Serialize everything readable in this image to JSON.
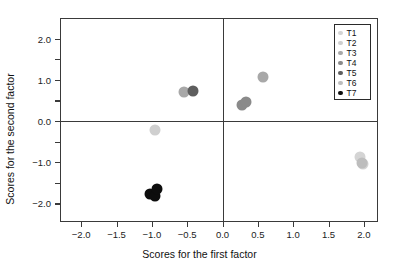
{
  "chart_data": {
    "type": "scatter",
    "title": "",
    "xlabel": "Scores for the first factor",
    "ylabel": "Scores for the second factor",
    "xlim": [
      -2.3,
      2.2
    ],
    "ylim": [
      -2.45,
      2.5
    ],
    "xticks": [
      "-2.0",
      "-1.5",
      "-1.0",
      "-0.5",
      "0.0",
      "0.5",
      "1.0",
      "1.5",
      "2.0"
    ],
    "xtick_values": [
      -2.0,
      -1.5,
      -1.0,
      -0.5,
      0.0,
      0.5,
      1.0,
      1.5,
      2.0
    ],
    "yticks": [
      "2.0",
      "1.0",
      "0.0",
      "-1.0",
      "-2.0"
    ],
    "ytick_values": [
      2.0,
      1.0,
      0.0,
      -1.0,
      -2.0
    ],
    "yminor_values": [
      1.5,
      0.5,
      -0.5,
      -1.5
    ],
    "grid": false,
    "reference_lines": {
      "x": 0.0,
      "y": 0.0
    },
    "legend_position": "top-right",
    "series": [
      {
        "name": "T1",
        "color": "#d4d4d4",
        "points": [
          {
            "x": 1.95,
            "y": -0.88
          },
          {
            "x": 1.99,
            "y": -1.05
          }
        ]
      },
      {
        "name": "T2",
        "color": "#cfcfcf",
        "points": [
          {
            "x": -0.95,
            "y": -0.22
          }
        ]
      },
      {
        "name": "T3",
        "color": "#a8a8a8",
        "points": [
          {
            "x": -0.55,
            "y": 0.7
          },
          {
            "x": 0.57,
            "y": 1.08
          }
        ]
      },
      {
        "name": "T4",
        "color": "#8a8a8a",
        "points": [
          {
            "x": 0.27,
            "y": 0.4
          },
          {
            "x": 0.33,
            "y": 0.45
          }
        ]
      },
      {
        "name": "T5",
        "color": "#5e5e5e",
        "points": [
          {
            "x": -0.42,
            "y": 0.73
          }
        ]
      },
      {
        "name": "T6",
        "color": "#bdbdbd",
        "points": [
          {
            "x": 1.97,
            "y": -1.02
          }
        ]
      },
      {
        "name": "T7",
        "color": "#0d0d0d",
        "points": [
          {
            "x": -1.03,
            "y": -1.76
          },
          {
            "x": -0.96,
            "y": -1.83
          },
          {
            "x": -0.93,
            "y": -1.66
          }
        ]
      }
    ]
  },
  "legend": {
    "entries": [
      {
        "label": "T1",
        "color": "#d4d4d4"
      },
      {
        "label": "T2",
        "color": "#cfcfcf"
      },
      {
        "label": "T3",
        "color": "#a8a8a8"
      },
      {
        "label": "T4",
        "color": "#8a8a8a"
      },
      {
        "label": "T5",
        "color": "#5e5e5e"
      },
      {
        "label": "T6",
        "color": "#bdbdbd"
      },
      {
        "label": "T7",
        "color": "#0d0d0d"
      }
    ]
  }
}
